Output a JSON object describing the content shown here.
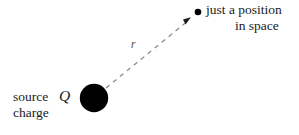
{
  "figure": {
    "background_color": "#ffffff",
    "width": 299,
    "height": 135
  },
  "elements": {
    "source_charge": {
      "label_line1": "source",
      "label_line2": "charge",
      "symbol": "Q",
      "color": "#000000",
      "center_x": 94,
      "center_y": 98,
      "radius": 14
    },
    "field_point": {
      "label_line1": "just a position",
      "label_line2": "in space",
      "color": "#000000",
      "center_x": 198,
      "center_y": 12,
      "radius": 3.2
    },
    "separation_vector": {
      "symbol": "r",
      "style": "dashed-arrow",
      "color": "#7a7a7a",
      "from_x": 106,
      "from_y": 88,
      "to_x": 190,
      "to_y": 19
    }
  }
}
